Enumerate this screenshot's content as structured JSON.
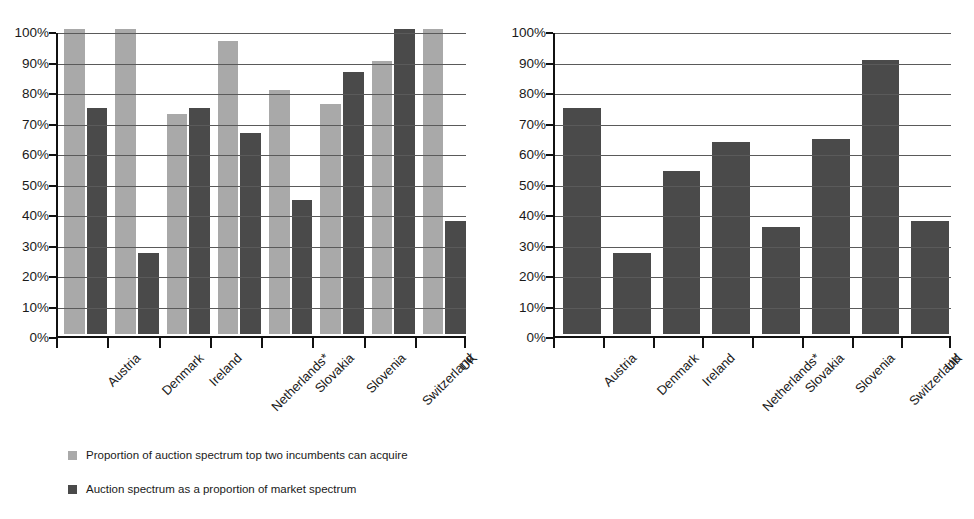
{
  "chart_data": [
    {
      "panel": "left",
      "type": "bar",
      "title": "",
      "xlabel": "",
      "ylabel": "",
      "ylim": [
        0,
        100
      ],
      "ytick_labels": [
        "0%",
        "10%",
        "20%",
        "30%",
        "40%",
        "50%",
        "60%",
        "70%",
        "80%",
        "90%",
        "100%"
      ],
      "ytick_values": [
        0,
        10,
        20,
        30,
        40,
        50,
        60,
        70,
        80,
        90,
        100
      ],
      "grid": true,
      "legend_position": "below",
      "categories": [
        "Austria",
        "Denmark",
        "Ireland",
        "Netherlands*",
        "Slovakia",
        "Slovenia",
        "Switzerland",
        "UK"
      ],
      "series": [
        {
          "name": "Proportion of auction spectrum top two incumbents can acquire",
          "color": "#a9a9a9",
          "values": [
            100,
            100,
            72,
            96,
            80,
            75.5,
            89.5,
            100
          ]
        },
        {
          "name": "Auction spectrum as a proportion of market spectrum",
          "color": "#4a4a4a",
          "values": [
            74,
            26.5,
            74,
            66,
            44,
            86,
            100,
            37
          ]
        }
      ]
    },
    {
      "panel": "right",
      "type": "bar",
      "title": "",
      "xlabel": "",
      "ylabel": "",
      "ylim": [
        0,
        100
      ],
      "ytick_labels": [
        "0%",
        "10%",
        "20%",
        "30%",
        "40%",
        "50%",
        "60%",
        "70%",
        "80%",
        "90%",
        "100%"
      ],
      "ytick_values": [
        0,
        10,
        20,
        30,
        40,
        50,
        60,
        70,
        80,
        90,
        100
      ],
      "grid": true,
      "legend_position": "below",
      "categories": [
        "Austria",
        "Denmark",
        "Ireland",
        "Netherlands*",
        "Slovakia",
        "Slovenia",
        "Switzerland",
        "UK"
      ],
      "series": [
        {
          "name": "Proportion of market spectrum top two incumbents can acquire",
          "color": "#4a4a4a",
          "values": [
            74,
            26.5,
            53.5,
            63,
            35,
            64,
            90,
            37
          ]
        }
      ]
    }
  ],
  "left_panel": {
    "legend": [
      {
        "label": "Proportion of auction spectrum top two incumbents can acquire",
        "swatch": "light"
      },
      {
        "label": "Auction spectrum as a proportion of market spectrum",
        "swatch": "dark"
      }
    ]
  },
  "right_panel": {
    "legend": [
      {
        "label": "Proportion of market spectrum top two incumbents can acquire",
        "swatch": "dark"
      }
    ]
  }
}
